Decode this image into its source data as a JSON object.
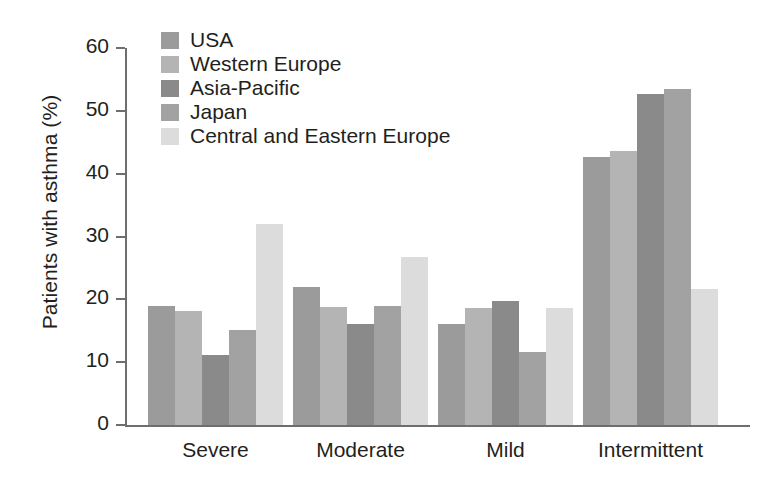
{
  "chart_data": {
    "type": "bar",
    "title": "",
    "xlabel": "",
    "ylabel": "Patients with asthma (%)",
    "ylim": [
      0,
      60
    ],
    "ytick_step": 10,
    "yticks": [
      "60",
      "50",
      "40",
      "30",
      "20",
      "10",
      "0"
    ],
    "grid": false,
    "legend_position": "top-left-inside",
    "categories": [
      "Severe",
      "Moderate",
      "Mild",
      "Intermittent"
    ],
    "series": [
      {
        "name": "USA",
        "color": "#9b9b9b",
        "values": [
          19.0,
          21.9,
          16.0,
          42.7
        ]
      },
      {
        "name": "Western Europe",
        "color": "#b4b4b4",
        "values": [
          18.2,
          18.8,
          18.7,
          43.6
        ]
      },
      {
        "name": "Asia-Pacific",
        "color": "#8a8a8a",
        "values": [
          11.2,
          16.0,
          19.7,
          52.7
        ]
      },
      {
        "name": "Japan",
        "color": "#a2a2a2",
        "values": [
          15.1,
          18.9,
          11.7,
          53.5
        ]
      },
      {
        "name": "Central and Eastern Europe",
        "color": "#dcdcdc",
        "values": [
          32.0,
          26.7,
          18.7,
          21.6
        ]
      }
    ]
  },
  "axis": {
    "y_title": "Patients with asthma (%)"
  },
  "colors": {
    "axis": "#6d6e70",
    "text": "#231f20",
    "background": "#ffffff"
  }
}
